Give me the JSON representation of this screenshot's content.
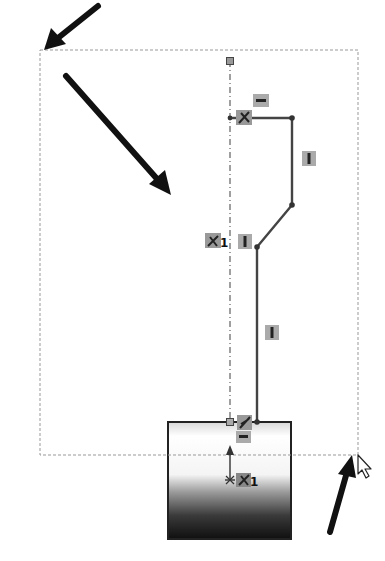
{
  "viewport": {
    "background": "#ffffff",
    "description": "Sketch window selection (box select) in a CAD sketch"
  },
  "selection_box": {
    "x1": 40,
    "y1": 50,
    "x2": 358,
    "y2": 455,
    "style": "dashed",
    "color": "#999999"
  },
  "arrows": [
    {
      "name": "arrow-to-box-start-corner",
      "from": [
        98,
        6
      ],
      "to": [
        44,
        50
      ]
    },
    {
      "name": "arrow-drag-direction",
      "from": [
        66,
        76
      ],
      "to": [
        170,
        194
      ]
    },
    {
      "name": "arrow-to-box-end-corner",
      "from": [
        330,
        532
      ],
      "to": [
        353,
        454
      ]
    }
  ],
  "centerline": {
    "x": 230,
    "y1": 61,
    "y2": 422,
    "style": "dash-dot",
    "color": "#888888"
  },
  "profile": {
    "points": [
      [
        230,
        118
      ],
      [
        292,
        118
      ],
      [
        292,
        205
      ],
      [
        257,
        247
      ],
      [
        257,
        422
      ]
    ],
    "color": "#444444"
  },
  "base_body": {
    "x": 168,
    "y": 422,
    "width": 123,
    "height": 117,
    "gradient": [
      "#ffffff",
      "#ffffff",
      "#111111"
    ]
  },
  "relations": [
    {
      "name": "horizontal-relation-top",
      "glyph": "—",
      "x": 261,
      "y": 101
    },
    {
      "name": "coincident-relation-top",
      "glyph": "✕",
      "x": 244,
      "y": 118
    },
    {
      "name": "vertical-relation-right",
      "glyph": "|",
      "x": 309,
      "y": 159
    },
    {
      "name": "vertical-relation-mid",
      "glyph": "|",
      "x": 245,
      "y": 241
    },
    {
      "name": "vertical-relation-lower",
      "glyph": "|",
      "x": 272,
      "y": 332
    },
    {
      "name": "coincident-relation-bottom",
      "glyph": "✕",
      "x": 244,
      "y": 422
    },
    {
      "name": "horizontal-relation-bottom",
      "glyph": "—",
      "x": 243,
      "y": 437
    }
  ],
  "labels": {
    "fix_centerline": "1",
    "fix_origin": "1"
  },
  "cursor": {
    "x": 356,
    "y": 455,
    "type": "arrow-pointer"
  }
}
